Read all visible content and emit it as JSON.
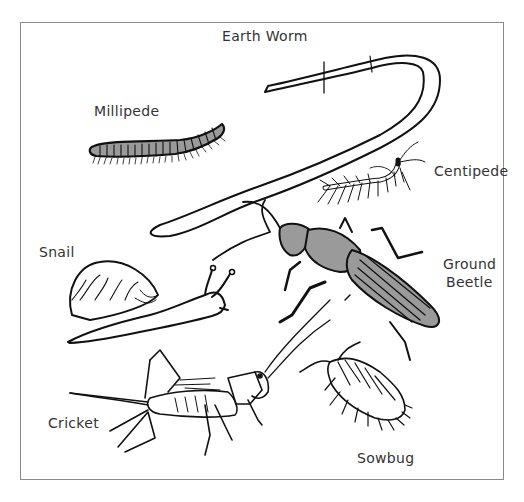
{
  "diagram": {
    "type": "illustration",
    "colors": {
      "outline": "#111111",
      "fill_gray": "#9a9a9a",
      "frame": "#8a8a8a",
      "background": "#ffffff"
    },
    "labels": {
      "earthworm": "Earth Worm",
      "millipede": "Millipede",
      "centipede": "Centipede",
      "snail": "Snail",
      "ground_beetle_line1": "Ground",
      "ground_beetle_line2": "Beetle",
      "cricket": "Cricket",
      "sowbug": "Sowbug"
    }
  }
}
